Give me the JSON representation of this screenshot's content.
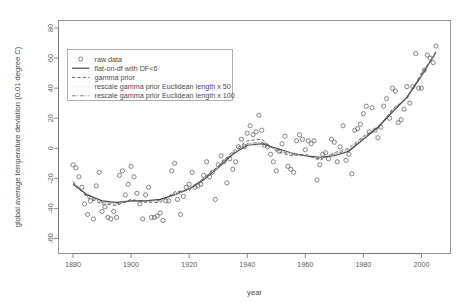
{
  "chart_data": {
    "type": "scatter",
    "title": "",
    "xlabel": "year",
    "ylabel": "global average temperature deviation (0.01 degree C)",
    "xlim": [
      1875,
      2010
    ],
    "ylim": [
      -70,
      85
    ],
    "xticks": [
      1880,
      1900,
      1920,
      1940,
      1960,
      1980,
      2000
    ],
    "yticks": [
      -60,
      -40,
      -20,
      0,
      20,
      40,
      60,
      80
    ],
    "grid": false,
    "legend_position": "top-left",
    "legend": [
      {
        "label": "raw data",
        "marker": "circle",
        "style": "none"
      },
      {
        "label": "flat-on-df with DF<6",
        "marker": "none",
        "style": "solid"
      },
      {
        "label": "gamma prior",
        "marker": "none",
        "style": "dashed"
      },
      {
        "label": "rescale gamma prior Euclidean length x 50",
        "marker": "none",
        "style": "dotted-faint"
      },
      {
        "label": "rescale gamma prior Euclidean length x 100",
        "marker": "none",
        "style": "dashdot"
      }
    ],
    "series": [
      {
        "name": "raw data",
        "type": "scatter",
        "x": [
          1880,
          1881,
          1882,
          1883,
          1884,
          1885,
          1886,
          1887,
          1888,
          1889,
          1890,
          1891,
          1892,
          1893,
          1894,
          1895,
          1896,
          1897,
          1898,
          1899,
          1900,
          1901,
          1902,
          1903,
          1904,
          1905,
          1906,
          1907,
          1908,
          1909,
          1910,
          1911,
          1912,
          1913,
          1914,
          1915,
          1916,
          1917,
          1918,
          1919,
          1920,
          1921,
          1922,
          1923,
          1924,
          1925,
          1926,
          1927,
          1928,
          1929,
          1930,
          1931,
          1932,
          1933,
          1934,
          1935,
          1936,
          1937,
          1938,
          1939,
          1940,
          1941,
          1942,
          1943,
          1944,
          1945,
          1946,
          1947,
          1948,
          1949,
          1950,
          1951,
          1952,
          1953,
          1954,
          1955,
          1956,
          1957,
          1958,
          1959,
          1960,
          1961,
          1962,
          1963,
          1964,
          1965,
          1966,
          1967,
          1968,
          1969,
          1970,
          1971,
          1972,
          1973,
          1974,
          1975,
          1976,
          1977,
          1978,
          1979,
          1980,
          1981,
          1982,
          1983,
          1984,
          1985,
          1986,
          1987,
          1988,
          1989,
          1990,
          1991,
          1992,
          1993,
          1994,
          1995,
          1996,
          1997,
          1998,
          1999,
          2000,
          2001,
          2002,
          2003,
          2004,
          2005
        ],
        "y": [
          -11,
          -13,
          -19,
          -26,
          -37,
          -44,
          -35,
          -47,
          -25,
          -16,
          -42,
          -39,
          -46,
          -47,
          -42,
          -46,
          -18,
          -15,
          -31,
          -24,
          -12,
          -19,
          -30,
          -37,
          -47,
          -31,
          -26,
          -46,
          -46,
          -45,
          -43,
          -48,
          -35,
          -35,
          -15,
          -10,
          -34,
          -44,
          -32,
          -26,
          -24,
          -16,
          -26,
          -25,
          -24,
          -18,
          -9,
          -19,
          -16,
          -34,
          -11,
          -5,
          -9,
          -23,
          -7,
          -14,
          -9,
          1,
          6,
          1,
          10,
          15,
          9,
          11,
          22,
          12,
          2,
          1,
          -4,
          -9,
          -15,
          -2,
          3,
          8,
          -12,
          -14,
          -16,
          5,
          9,
          6,
          -1,
          5,
          3,
          5,
          -21,
          -11,
          -4,
          -3,
          -7,
          6,
          4,
          -9,
          1,
          15,
          -8,
          -4,
          -17,
          12,
          13,
          16,
          23,
          28,
          11,
          27,
          12,
          7,
          14,
          28,
          33,
          20,
          40,
          38,
          17,
          19,
          26,
          41,
          30,
          41,
          63,
          40,
          40,
          52,
          62,
          60,
          57,
          68
        ],
        "marker": "open-circle",
        "color": "#5e5e5e"
      },
      {
        "name": "flat-on-df with DF<6",
        "type": "line",
        "x": [
          1880,
          1885,
          1890,
          1895,
          1900,
          1905,
          1910,
          1915,
          1920,
          1925,
          1930,
          1935,
          1940,
          1945,
          1950,
          1955,
          1960,
          1965,
          1970,
          1975,
          1980,
          1985,
          1990,
          1995,
          2000,
          2005
        ],
        "y": [
          -24,
          -31,
          -35,
          -36,
          -35,
          -35,
          -34,
          -31,
          -27,
          -21,
          -13,
          -4,
          2,
          3,
          0,
          -3,
          -5,
          -6,
          -5,
          -2,
          6,
          14,
          24,
          34,
          48,
          64
        ],
        "style": "solid",
        "color": "#404040"
      },
      {
        "name": "gamma prior",
        "type": "line",
        "x": [
          1880,
          1885,
          1890,
          1895,
          1900,
          1905,
          1910,
          1915,
          1920,
          1925,
          1930,
          1935,
          1940,
          1945,
          1950,
          1955,
          1960,
          1965,
          1970,
          1975,
          1980,
          1985,
          1990,
          1995,
          2000,
          2005
        ],
        "y": [
          -22,
          -33,
          -37,
          -38,
          -34,
          -36,
          -36,
          -29,
          -28,
          -20,
          -12,
          -2,
          5,
          6,
          -2,
          -5,
          -4,
          -8,
          -3,
          0,
          8,
          13,
          26,
          33,
          50,
          63
        ],
        "style": "dashed",
        "color": "#4a4a4a"
      },
      {
        "name": "rescale gamma prior Euclidean length x 50",
        "type": "line",
        "x": [
          1880,
          1890,
          1900,
          1910,
          1920,
          1930,
          1940,
          1950,
          1960,
          1970,
          1980,
          1990,
          2000,
          2005
        ],
        "y": [
          -23,
          -36,
          -35,
          -35,
          -27,
          -13,
          3,
          -1,
          -5,
          -4,
          6,
          25,
          48,
          64
        ],
        "style": "dotted-faint",
        "color": "#c8c8c8"
      },
      {
        "name": "rescale gamma prior Euclidean length x 100",
        "type": "line",
        "x": [
          1880,
          1885,
          1890,
          1895,
          1900,
          1905,
          1910,
          1915,
          1920,
          1925,
          1930,
          1935,
          1940,
          1945,
          1950,
          1955,
          1960,
          1965,
          1970,
          1975,
          1980,
          1985,
          1990,
          1995,
          2000,
          2005
        ],
        "y": [
          -23,
          -32,
          -36,
          -37,
          -35,
          -35,
          -35,
          -30,
          -27,
          -20,
          -12,
          -3,
          3,
          4,
          -1,
          -4,
          -5,
          -7,
          -4,
          -1,
          7,
          14,
          25,
          34,
          49,
          64
        ],
        "style": "dashdot",
        "color": "#555555"
      }
    ]
  }
}
